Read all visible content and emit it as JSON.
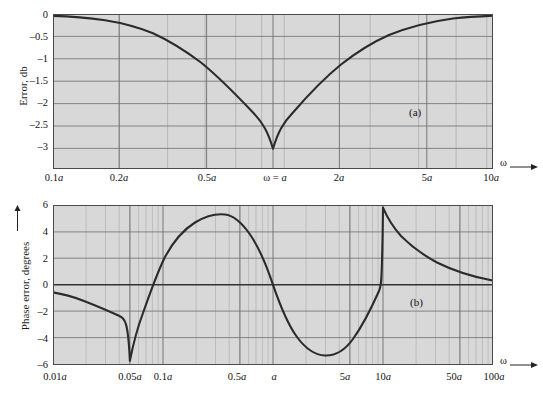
{
  "figure": {
    "background_color": "#ffffff",
    "plot_fill": "#d8d8d8",
    "grid_major_color": "#6e6e6e",
    "grid_minor_color": "#a8a8a8",
    "curve_color": "#2b2b2b",
    "axis_color": "#333333",
    "omega_symbol": "ω",
    "axis_arrow_label_a": "ω",
    "axis_arrow_label_b": "ω"
  },
  "panel_a": {
    "tag": "(a)",
    "ylabel": "Error, db",
    "xlabel": "ω",
    "ytick_labels": [
      "0",
      "–0.5",
      "–1",
      "–1.5",
      "–2",
      "–2.5",
      "–3"
    ],
    "xtick_labels": [
      "0.1a",
      "0.2a",
      "0.5a",
      "ω = a",
      "2a",
      "5a",
      "10a"
    ]
  },
  "panel_b": {
    "tag": "(b)",
    "ylabel": "Phase error, degrees",
    "xlabel": "ω",
    "ytick_labels": [
      "6",
      "4",
      "2",
      "0",
      "–2",
      "–4",
      "–6"
    ],
    "xtick_labels": [
      "0.01a",
      "0.05a",
      "0.1a",
      "0.5a",
      "a",
      "5a",
      "10a",
      "50a",
      "100a"
    ]
  },
  "chart_data": [
    {
      "type": "line",
      "id": "panel_a_magnitude_error",
      "title": "",
      "panel_tag": "(a)",
      "xlabel": "ω",
      "ylabel": "Error, db",
      "xscale": "log",
      "xlim": [
        0.1,
        10
      ],
      "ylim": [
        -3.45,
        0
      ],
      "ytick_values": [
        0,
        -0.5,
        -1,
        -1.5,
        -2,
        -2.5,
        -3
      ],
      "ytick_labels": [
        "0",
        "–0.5",
        "–1",
        "–1.5",
        "–2",
        "–2.5",
        "–3"
      ],
      "xtick_values": [
        0.1,
        0.2,
        0.5,
        1,
        2,
        5,
        10
      ],
      "xtick_labels": [
        "0.1a",
        "0.2a",
        "0.5a",
        "ω = a",
        "2a",
        "5a",
        "10a"
      ],
      "grid": true,
      "grid_minor": true,
      "legend": "none",
      "annotations": [
        "(a)"
      ],
      "description": "Bode magnitude approximation error of a single pole: 20*log10(|straight-line asymptote| / |actual|); minimum of -3.01 dB at omega = a, approaching 0 dB at both 0.1a and 10a.",
      "series": [
        {
          "name": "magnitude error",
          "x": [
            0.1,
            0.12,
            0.15,
            0.18,
            0.2,
            0.25,
            0.3,
            0.35,
            0.4,
            0.45,
            0.5,
            0.55,
            0.6,
            0.65,
            0.7,
            0.75,
            0.8,
            0.85,
            0.9,
            0.95,
            1.0,
            1.05,
            1.1,
            1.2,
            1.3,
            1.4,
            1.5,
            1.7,
            2.0,
            2.5,
            3.0,
            3.5,
            4.0,
            5.0,
            6.0,
            7.0,
            8.0,
            9.0,
            10.0
          ],
          "y": [
            -0.043,
            -0.062,
            -0.097,
            -0.138,
            -0.17,
            -0.26,
            -0.37,
            -0.5,
            -0.64,
            -0.79,
            -0.97,
            -1.15,
            -1.34,
            -1.54,
            -1.74,
            -1.94,
            -2.15,
            -2.35,
            -2.55,
            -2.74,
            -3.01,
            -2.77,
            -2.55,
            -2.17,
            -1.84,
            -1.56,
            -1.34,
            -1.0,
            -0.69,
            -0.41,
            -0.28,
            -0.2,
            -0.15,
            -0.1,
            -0.07,
            -0.05,
            -0.04,
            -0.03,
            -0.025
          ]
        }
      ]
    },
    {
      "type": "line",
      "id": "panel_b_phase_error",
      "title": "",
      "panel_tag": "(b)",
      "xlabel": "ω",
      "ylabel": "Phase error, degrees",
      "xscale": "log",
      "xlim": [
        0.01,
        100
      ],
      "ylim": [
        -6,
        6
      ],
      "ytick_values": [
        6,
        4,
        2,
        0,
        -2,
        -4,
        -6
      ],
      "ytick_labels": [
        "6",
        "4",
        "2",
        "0",
        "–2",
        "–4",
        "–6"
      ],
      "xtick_values": [
        0.01,
        0.05,
        0.1,
        0.5,
        1,
        5,
        10,
        50,
        100
      ],
      "xtick_labels": [
        "0.01a",
        "0.05a",
        "0.1a",
        "0.5a",
        "a",
        "5a",
        "10a",
        "50a",
        "100a"
      ],
      "grid": true,
      "grid_minor": true,
      "legend": "none",
      "annotations": [
        "(b)"
      ],
      "description": "Phase error of the three-segment straight-line phase approximation for a single pole. Sharp negative cusp of about -5.7 degrees at 0.1a, positive lobe peaking near +5.3 degrees at about 0.3a, crossing zero at a, negative lobe minimum near -5.3 degrees at about 3a, sharp positive cusp of about +5.7 degrees at 10a, then decaying toward zero.",
      "series": [
        {
          "name": "phase error",
          "x": [
            0.01,
            0.013,
            0.017,
            0.022,
            0.03,
            0.04,
            0.05,
            0.06,
            0.07,
            0.08,
            0.09,
            0.1,
            0.11,
            0.13,
            0.15,
            0.18,
            0.21,
            0.25,
            0.3,
            0.35,
            0.4,
            0.5,
            0.6,
            0.7,
            0.8,
            0.9,
            1.0,
            1.2,
            1.5,
            2.0,
            2.5,
            3.0,
            3.5,
            4.0,
            5.0,
            6.0,
            7.0,
            8.0,
            9.0,
            10.0,
            12.0,
            15.0,
            20.0,
            30.0,
            40.0,
            50.0,
            70.0,
            100.0
          ],
          "y": [
            -0.57,
            -0.75,
            -0.97,
            -1.26,
            -1.72,
            -2.29,
            -2.86,
            -3.43,
            -4.0,
            -4.57,
            -5.14,
            -5.71,
            -3.5,
            -1.3,
            0.6,
            2.8,
            4.2,
            5.1,
            5.3,
            5.25,
            4.95,
            4.0,
            3.0,
            2.0,
            1.2,
            0.5,
            0.0,
            -1.2,
            -2.8,
            -4.4,
            -5.15,
            -5.3,
            -5.15,
            -4.8,
            -4.0,
            -3.1,
            -2.3,
            -1.5,
            -0.75,
            5.71,
            4.6,
            3.6,
            2.7,
            1.85,
            1.4,
            1.15,
            0.8,
            0.55
          ]
        }
      ]
    }
  ]
}
